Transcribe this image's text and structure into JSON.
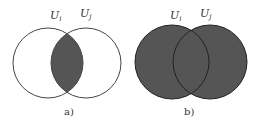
{
  "diagrams": [
    {
      "id": "a",
      "caption": "a)",
      "set_labels": [
        {
          "main": "U",
          "sub": "i"
        },
        {
          "main": "U",
          "sub": "j"
        }
      ],
      "shaded": "intersection",
      "fill_color": "#555555"
    },
    {
      "id": "b",
      "caption": "b)",
      "set_labels": [
        {
          "main": "U",
          "sub": "i"
        },
        {
          "main": "U",
          "sub": "j"
        }
      ],
      "shaded": "union",
      "fill_color": "#555555"
    }
  ],
  "colors": {
    "stroke": "#333333",
    "fill": "#555555",
    "background": "#ffffff"
  }
}
